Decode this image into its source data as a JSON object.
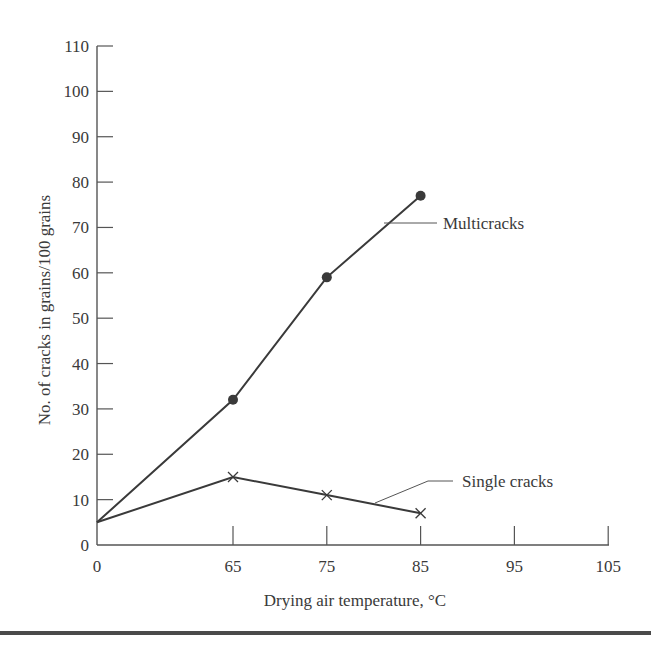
{
  "chart_data": {
    "type": "line",
    "title": "",
    "xlabel": "Drying air temperature, °C",
    "ylabel": "No. of cracks in grains/100 grains",
    "x_ticks": [
      0,
      65,
      75,
      85,
      95,
      105
    ],
    "x_tick_labels": [
      "0",
      "65",
      "75",
      "85",
      "95",
      "105"
    ],
    "y_ticks": [
      0,
      10,
      20,
      30,
      40,
      50,
      60,
      70,
      80,
      90,
      100,
      110
    ],
    "y_tick_labels": [
      "0",
      "10",
      "20",
      "30",
      "40",
      "50",
      "60",
      "70",
      "80",
      "90",
      "100",
      "110"
    ],
    "ylim": [
      0,
      110
    ],
    "grid": false,
    "legend_position": "inline-annotations",
    "x": [
      0,
      65,
      75,
      85
    ],
    "series": [
      {
        "name": "Multicracks",
        "marker": "filled-circle",
        "values": [
          5,
          32,
          59,
          77
        ]
      },
      {
        "name": "Single cracks",
        "marker": "x",
        "values": [
          5,
          15,
          11,
          7
        ]
      }
    ],
    "annotations": [
      {
        "text": "Multicracks",
        "points_to_series": "Multicracks"
      },
      {
        "text": "Single cracks",
        "points_to_series": "Single cracks"
      }
    ],
    "colors": {
      "line": "#3a3a3a",
      "axis": "#555555",
      "rule": "#4a4a4a"
    }
  }
}
